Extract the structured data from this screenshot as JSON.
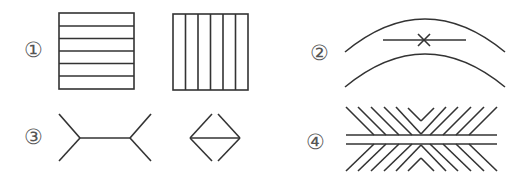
{
  "figures": [
    {
      "id": "1",
      "label": "①",
      "description": "Two squares: one with horizontal stripes, one with vertical stripes"
    },
    {
      "id": "2",
      "label": "②",
      "description": "Two parallel arcs with a horizontal line segment and X mark between them"
    },
    {
      "id": "3",
      "label": "③",
      "description": "Müller-Lyer illusion: line with outward fins vs line with inward arrowheads"
    },
    {
      "id": "4",
      "label": "④",
      "description": "Hering/Zöllner-type illusion: two parallel horizontal lines with oblique hatching"
    }
  ],
  "colors": {
    "stroke": "#333333",
    "label": "#555555",
    "background": "#ffffff"
  }
}
